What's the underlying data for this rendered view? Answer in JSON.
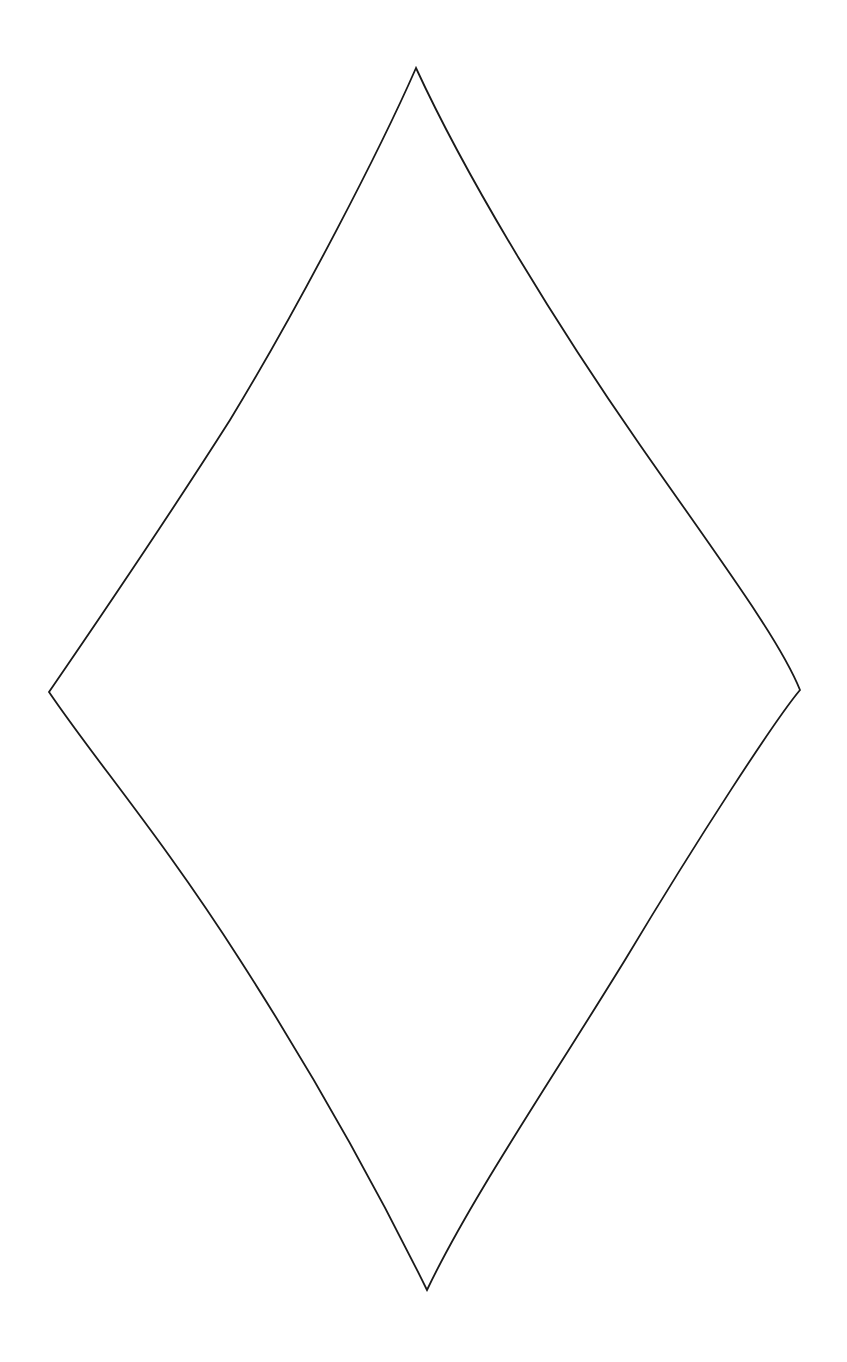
{
  "canvas": {
    "width": 847,
    "height": 1362,
    "background": "#ffffff"
  },
  "shape": {
    "type": "concave-diamond",
    "stroke_color": "#1a1a1a",
    "stroke_width": 1.8,
    "fill": "none",
    "vertices": {
      "top": [
        416,
        68
      ],
      "right": [
        800,
        690
      ],
      "bottom": [
        427,
        1290
      ],
      "left": [
        49,
        692
      ]
    },
    "path": "M 416 68 C 470 185, 560 330, 640 445 C 720 560, 780 640, 800 690 C 775 720, 700 835, 625 960 C 545 1090, 470 1200, 427 1290 C 395 1225, 330 1100, 240 960 C 160 835, 95 760, 49 692 C 95 625, 160 530, 230 420 C 300 305, 380 150, 416 68 Z"
  }
}
